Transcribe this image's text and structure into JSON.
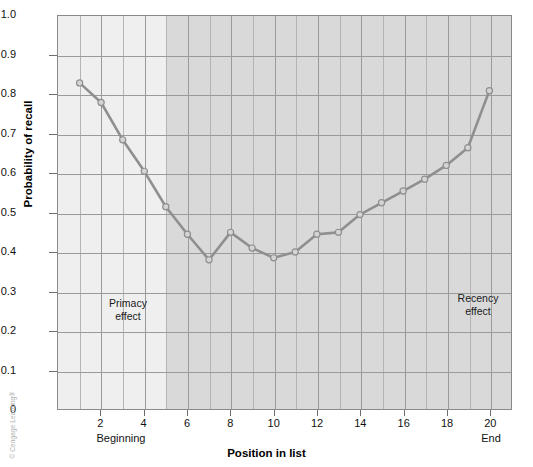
{
  "chart_data": {
    "type": "line",
    "title": "",
    "xlabel": "Position in list",
    "ylabel": "Probability of recall",
    "xlim": [
      0,
      21
    ],
    "ylim": [
      0,
      1.0
    ],
    "grid": true,
    "legend": "none",
    "x": [
      1,
      2,
      3,
      4,
      5,
      6,
      7,
      8,
      9,
      10,
      11,
      12,
      13,
      14,
      15,
      16,
      17,
      18,
      19,
      20
    ],
    "values": [
      0.83,
      0.78,
      0.685,
      0.605,
      0.515,
      0.445,
      0.38,
      0.45,
      0.41,
      0.385,
      0.4,
      0.445,
      0.45,
      0.495,
      0.525,
      0.555,
      0.585,
      0.62,
      0.665,
      0.81
    ],
    "series": [
      {
        "name": "Probability of recall",
        "values": [
          0.83,
          0.78,
          0.685,
          0.605,
          0.515,
          0.445,
          0.38,
          0.45,
          0.41,
          0.385,
          0.4,
          0.445,
          0.45,
          0.495,
          0.525,
          0.555,
          0.585,
          0.62,
          0.665,
          0.81
        ]
      }
    ],
    "y_ticks": [
      "0",
      "0.1",
      "0.2",
      "0.3",
      "0.4",
      "0.5",
      "0.6",
      "0.7",
      "0.8",
      "0.9",
      "1.0"
    ],
    "y_tick_values": [
      0,
      0.1,
      0.2,
      0.3,
      0.4,
      0.5,
      0.6,
      0.7,
      0.8,
      0.9,
      1.0
    ],
    "x_ticks": [
      "2",
      "4",
      "6",
      "8",
      "10",
      "12",
      "14",
      "16",
      "18",
      "20"
    ],
    "x_tick_values": [
      2,
      4,
      6,
      8,
      10,
      12,
      14,
      16,
      18,
      20
    ],
    "annotations": [
      {
        "text": "Primacy\neffect",
        "x": 2.5,
        "y": 0.27
      },
      {
        "text": "Recency\neffect",
        "x": 18.0,
        "y": 0.29
      }
    ],
    "axis_end_labels": {
      "left": "Beginning",
      "right": "End"
    },
    "regions": [
      {
        "name": "primacy-band",
        "x_from": 1,
        "x_to": 5,
        "color": "#efefef"
      },
      {
        "name": "recency-band",
        "x_from": 5,
        "x_to": 21,
        "color": "#d9d9d9"
      }
    ],
    "colors": {
      "line": "#8f8f8f",
      "marker_fill": "#d4d4d4",
      "marker_stroke": "#8f8f8f",
      "grid": "#9a9a9a",
      "frame": "#8a8a8a",
      "plot_background": "#ededed"
    }
  },
  "axes": {
    "y_title": "Probability of recall",
    "x_title": "Position in list",
    "begin_label": "Beginning",
    "end_label": "End"
  },
  "annotations": {
    "primacy": "Primacy\neffect",
    "recency": "Recency\neffect"
  },
  "footer": {
    "copyright": "© Cengage Learning®"
  }
}
